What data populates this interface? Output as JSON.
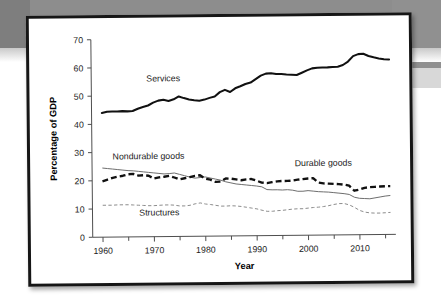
{
  "chart_data": {
    "type": "line",
    "title": "",
    "xlabel": "Year",
    "ylabel": "Percentage of GDP",
    "xlim": [
      1958,
      2017
    ],
    "ylim": [
      0,
      70
    ],
    "grid": false,
    "legend": "inline-labels",
    "y_ticks": [
      0,
      10,
      20,
      30,
      40,
      50,
      60,
      70
    ],
    "y_tick_labels": [
      "0",
      "10",
      "20",
      "30",
      "40",
      "50",
      "60",
      "70"
    ],
    "x_ticks": [
      1960,
      1970,
      1980,
      1990,
      2000,
      2010
    ],
    "x_tick_labels": [
      "1960",
      "1970",
      "1980",
      "1990",
      "2000",
      "2010"
    ],
    "x_minor_ticks": [
      1965,
      1975,
      1985,
      1995,
      2005,
      2015
    ],
    "x": [
      1960,
      1961,
      1962,
      1963,
      1964,
      1965,
      1966,
      1967,
      1968,
      1969,
      1970,
      1971,
      1972,
      1973,
      1974,
      1975,
      1976,
      1977,
      1978,
      1979,
      1980,
      1981,
      1982,
      1983,
      1984,
      1985,
      1986,
      1987,
      1988,
      1989,
      1990,
      1991,
      1992,
      1993,
      1994,
      1995,
      1996,
      1997,
      1998,
      1999,
      2000,
      2001,
      2002,
      2003,
      2004,
      2005,
      2006,
      2007,
      2008,
      2009,
      2010,
      2011,
      2012,
      2013,
      2014,
      2015,
      2016
    ],
    "series": [
      {
        "name": "Services",
        "style": "solid-thick-black",
        "color": "#111111",
        "label_x": 1972,
        "label_y": 55,
        "values": [
          44.0,
          44.4,
          44.5,
          44.5,
          44.6,
          44.5,
          44.6,
          45.4,
          46.0,
          46.5,
          47.5,
          48.2,
          48.5,
          48.0,
          48.6,
          49.6,
          49.0,
          48.5,
          48.2,
          48.0,
          48.4,
          49.0,
          49.5,
          51.0,
          51.8,
          51.0,
          52.3,
          53.0,
          53.8,
          54.3,
          55.5,
          56.7,
          57.4,
          57.5,
          57.2,
          57.2,
          57.0,
          56.9,
          56.8,
          57.6,
          58.4,
          59.1,
          59.3,
          59.4,
          59.4,
          59.5,
          59.6,
          60.2,
          61.4,
          63.3,
          64.0,
          64.1,
          63.3,
          62.8,
          62.4,
          62.1,
          62.0
        ]
      },
      {
        "name": "Nondurable goods",
        "style": "solid-thin-gray",
        "color": "#6a6a6a",
        "label_x": 1969,
        "label_y": 27.5,
        "values": [
          24.5,
          24.3,
          24.1,
          23.9,
          23.7,
          23.5,
          23.4,
          23.2,
          23.0,
          22.8,
          22.6,
          22.4,
          22.2,
          22.3,
          22.5,
          22.0,
          21.5,
          21.0,
          20.6,
          20.8,
          21.0,
          20.6,
          20.2,
          19.8,
          19.2,
          18.8,
          18.4,
          18.2,
          18.0,
          17.8,
          17.6,
          17.3,
          16.3,
          16.2,
          16.2,
          16.1,
          16.2,
          16.0,
          15.6,
          15.6,
          15.8,
          15.6,
          15.4,
          15.3,
          15.2,
          15.0,
          14.8,
          14.6,
          14.3,
          13.3,
          12.9,
          12.8,
          12.7,
          13.0,
          13.3,
          13.6,
          13.8
        ]
      },
      {
        "name": "Durable goods",
        "style": "dashed-thick-black",
        "color": "#111111",
        "label_x": 2003,
        "label_y": 24.5,
        "values": [
          19.8,
          20.4,
          21.0,
          21.4,
          21.7,
          22.2,
          22.3,
          21.7,
          21.8,
          21.6,
          20.6,
          21.0,
          21.2,
          21.5,
          20.9,
          20.2,
          20.6,
          21.0,
          21.4,
          21.6,
          20.4,
          20.0,
          19.2,
          19.3,
          20.4,
          20.3,
          20.0,
          19.7,
          20.0,
          20.1,
          19.5,
          18.8,
          18.6,
          18.9,
          19.2,
          19.3,
          19.3,
          19.4,
          19.7,
          19.9,
          20.1,
          20.2,
          18.6,
          18.3,
          18.2,
          18.1,
          18.0,
          17.8,
          17.4,
          15.6,
          16.0,
          16.6,
          16.8,
          16.9,
          17.0,
          17.1,
          17.1
        ]
      },
      {
        "name": "Structures",
        "style": "dashed-thin-gray",
        "color": "#8a8a8a",
        "label_x": 1971,
        "label_y": 7.5,
        "values": [
          11.3,
          11.3,
          11.3,
          11.4,
          11.4,
          11.4,
          11.3,
          11.2,
          11.1,
          11.0,
          11.0,
          11.1,
          11.2,
          11.2,
          11.1,
          10.8,
          10.8,
          11.0,
          11.5,
          11.8,
          11.4,
          11.2,
          10.9,
          10.6,
          10.6,
          10.7,
          10.6,
          10.4,
          10.1,
          9.8,
          9.5,
          9.0,
          8.6,
          8.6,
          8.8,
          8.9,
          9.1,
          9.3,
          9.4,
          9.4,
          9.6,
          9.8,
          9.9,
          10.1,
          10.4,
          10.8,
          11.1,
          11.1,
          10.6,
          9.7,
          8.6,
          8.0,
          7.7,
          7.6,
          7.6,
          7.7,
          7.8
        ]
      }
    ]
  }
}
